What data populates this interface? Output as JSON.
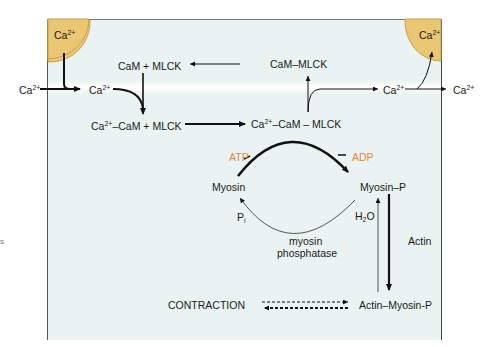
{
  "diagram": {
    "colors": {
      "background": "#eaf3f1",
      "store_fill": "#e9c773",
      "store_stroke": "#c8a04a",
      "highlight_text": "#e0873a",
      "text": "#1a1a1a"
    },
    "stores": [
      {
        "id": "sr-left",
        "label_base": "Ca",
        "label_sup": "2+"
      },
      {
        "id": "sr-right",
        "label_base": "Ca",
        "label_sup": "2+"
      }
    ],
    "labels": {
      "ca_outside_left": {
        "base": "Ca",
        "sup": "2+"
      },
      "ca_inside_left": {
        "base": "Ca",
        "sup": "2+"
      },
      "cam_mlck": "CaM + MLCK",
      "cam_mlck_complex": "CaM–MLCK",
      "ca_cam_plus_mlck": {
        "pre": "Ca",
        "sup": "2+",
        "post": "–CaM + MLCK"
      },
      "ca_cam_mlck": {
        "pre": "Ca",
        "sup": "2+",
        "post": "–CaM – MLCK"
      },
      "ca_inside_right": {
        "base": "Ca",
        "sup": "2+"
      },
      "ca_outside_right": {
        "base": "Ca",
        "sup": "2+"
      },
      "atp": "ATP",
      "adp": "ADP",
      "myosin": "Myosin",
      "myosin_p": "Myosin–P",
      "pi": {
        "base": "P",
        "sub": "i"
      },
      "h2o": {
        "pre": "H",
        "sub": "2",
        "post": "O"
      },
      "myosin_phosphatase_line1": "myosin",
      "myosin_phosphatase_line2": "phosphatase",
      "actin": "Actin",
      "contraction": "CONTRACTION",
      "actin_myosin_p": "Actin–Myosin-P",
      "edge_fragment": "s"
    }
  }
}
